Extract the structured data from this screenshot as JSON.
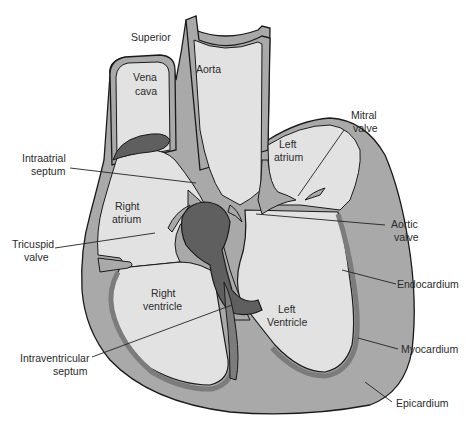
{
  "diagram": {
    "colors": {
      "background": "#ffffff",
      "chamber_fill": "#e2e2e2",
      "myocardium_fill": "#a9a9a9",
      "endocardium_fill": "#7c7c7c",
      "dark_structure": "#5f5f5f",
      "outline": "#1a1a1a",
      "text": "#2b2b2b"
    },
    "labels": {
      "superior": "Superior",
      "vena": "Vena",
      "cava": "cava",
      "aorta": "Aorta",
      "mitral_1": "Mitral",
      "mitral_2": "valve",
      "left_atrium_1": "Left",
      "left_atrium_2": "atrium",
      "intraatrial_1": "Intraatrial",
      "intraatrial_2": "septum",
      "right_atrium_1": "Right",
      "right_atrium_2": "atrium",
      "aortic_1": "Aortic",
      "aortic_2": "valve",
      "tricuspid_1": "Tricuspid",
      "tricuspid_2": "valve",
      "endocardium": "Endocardium",
      "right_ventricle_1": "Right",
      "right_ventricle_2": "ventricle",
      "left_ventricle_1": "Left",
      "left_ventricle_2": "Ventricle",
      "myocardium": "Myocardium",
      "intraventricular_1": "Intraventricular",
      "intraventricular_2": "septum",
      "epicardium": "Epicardium"
    }
  }
}
